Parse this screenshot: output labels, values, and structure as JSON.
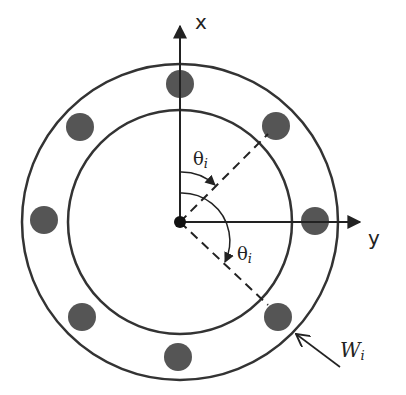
{
  "diagram": {
    "title": "",
    "center": {
      "x": 180,
      "y": 222
    },
    "outer_ring": {
      "radius": 158,
      "stroke": "#333333"
    },
    "inner_ring": {
      "radius": 112,
      "stroke": "#333333"
    },
    "bolt_ring_radius": 135,
    "bolt_radius": 14,
    "bolt_color": "#555555",
    "bolt_count": 8,
    "labels": {
      "x_axis": "x",
      "y_axis": "y",
      "theta_1": "θ",
      "theta_1_sub": "i",
      "theta_2": "θ",
      "theta_2_sub": "i",
      "weight": "W",
      "weight_sub": "i"
    }
  }
}
